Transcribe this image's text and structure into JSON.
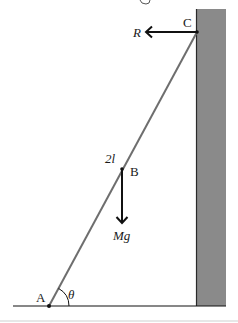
{
  "diagram": {
    "colors": {
      "background": "#ffffff",
      "wall_fill": "#8a8a8a",
      "wall_edge": "#2a2a2a",
      "rod": "#6e6e6e",
      "ink": "#111111",
      "separator": "#cfcfcf"
    },
    "points": {
      "A": {
        "label": "A",
        "x": 49,
        "y": 306
      },
      "B": {
        "label": "B",
        "x": 122,
        "y": 169
      },
      "C": {
        "label": "C",
        "x": 197,
        "y": 32
      }
    },
    "labels": {
      "point_a": "A",
      "point_b": "B",
      "point_c": "C",
      "length": "2l",
      "angle": "θ",
      "reaction_force": "R",
      "weight_force": "Mg"
    },
    "forces": [
      {
        "name": "R",
        "from": "C",
        "direction": "left",
        "length": 52
      },
      {
        "name": "Mg",
        "from": "B",
        "direction": "down",
        "length": 55
      }
    ],
    "wall": {
      "x": 196,
      "y": 9,
      "width": 30,
      "height": 297
    },
    "ground": {
      "x1": 13,
      "x2": 226,
      "y": 306
    }
  }
}
